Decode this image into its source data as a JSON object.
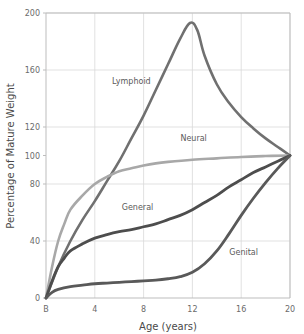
{
  "chart_data": {
    "type": "line",
    "title": "",
    "xlabel": "Age (years)",
    "ylabel": "Percentage of Mature Weight",
    "xlim": [
      0,
      20
    ],
    "ylim": [
      0,
      200
    ],
    "grid": true,
    "legend": "inline-labels",
    "x_tick_labels": [
      "B",
      "4",
      "8",
      "12",
      "16",
      "20"
    ],
    "x_tick_values": [
      0,
      4,
      8,
      12,
      16,
      20
    ],
    "y_tick_labels": [
      "0",
      "40",
      "80",
      "100",
      "120",
      "160",
      "200"
    ],
    "y_tick_values": [
      0,
      40,
      80,
      100,
      120,
      160,
      200
    ],
    "y_gridline_values": [
      40,
      80,
      120,
      160,
      200
    ],
    "series": [
      {
        "name": "Lymphoid",
        "color": "#707070",
        "width": 2.6,
        "label_x": 7.0,
        "label_y": 150,
        "x": [
          0,
          1,
          2,
          3,
          4,
          5,
          6,
          7,
          8,
          9,
          10,
          11,
          11.8,
          12.4,
          13,
          14,
          15,
          16,
          17,
          18,
          19,
          20
        ],
        "values": [
          0,
          22,
          40,
          55,
          68,
          82,
          96,
          112,
          128,
          146,
          164,
          182,
          193,
          188,
          170,
          150,
          137,
          127,
          119,
          112,
          106,
          100
        ]
      },
      {
        "name": "Neural",
        "color": "#a8a8a8",
        "width": 2.6,
        "label_x": 12.1,
        "label_y": 110,
        "x": [
          0,
          0.5,
          1,
          1.5,
          2,
          3,
          4,
          5,
          6,
          7,
          8,
          9,
          10,
          12,
          14,
          16,
          18,
          20
        ],
        "values": [
          0,
          22,
          40,
          52,
          62,
          72,
          80,
          85,
          89,
          91,
          93,
          94.5,
          95.5,
          97,
          98,
          99,
          99.6,
          100
        ]
      },
      {
        "name": "General",
        "color": "#4d4d4d",
        "width": 2.8,
        "label_x": 7.5,
        "label_y": 62,
        "x": [
          0,
          0.5,
          1,
          1.5,
          2,
          3,
          4,
          5,
          6,
          7,
          8,
          9,
          10,
          11,
          12,
          13,
          14,
          15,
          16,
          17,
          18,
          19,
          20
        ],
        "values": [
          0,
          12,
          22,
          28,
          33,
          38,
          42,
          44.5,
          46.5,
          48,
          50,
          52,
          55,
          58,
          62,
          67,
          72,
          78,
          83,
          88,
          92,
          96,
          100
        ]
      },
      {
        "name": "Genital",
        "color": "#595959",
        "width": 2.8,
        "label_x": 16.2,
        "label_y": 30,
        "x": [
          0,
          0.5,
          1,
          2,
          3,
          4,
          5,
          6,
          7,
          8,
          9,
          10,
          11,
          12,
          13,
          14,
          15,
          16,
          17,
          18,
          19,
          20
        ],
        "values": [
          0,
          4,
          6,
          8,
          9,
          10,
          10.5,
          11,
          11.5,
          12,
          12.5,
          13.5,
          15,
          18,
          24,
          33,
          45,
          58,
          70,
          81,
          91,
          100
        ]
      }
    ]
  },
  "axes": {
    "x_title": "Age (years)",
    "y_title": "Percentage of Mature Weight"
  }
}
